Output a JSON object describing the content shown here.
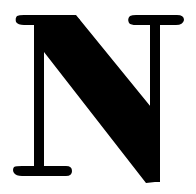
{
  "glyph": {
    "letter": "N",
    "color": "#000000",
    "background": "#ffffff"
  }
}
